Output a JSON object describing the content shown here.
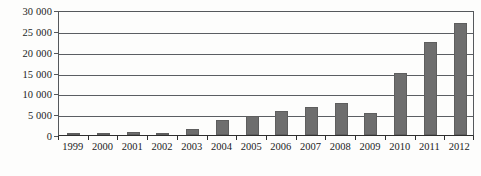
{
  "chart_data": {
    "type": "bar",
    "title": "",
    "xlabel": "",
    "ylabel": "",
    "categories": [
      "1999",
      "2000",
      "2001",
      "2002",
      "2003",
      "2004",
      "2005",
      "2006",
      "2007",
      "2008",
      "2009",
      "2010",
      "2011",
      "2012"
    ],
    "values": [
      200,
      250,
      700,
      600,
      1500,
      3500,
      4500,
      5700,
      6700,
      7700,
      5300,
      14800,
      22400,
      26800
    ],
    "ylim": [
      0,
      30000
    ],
    "ytick_values": [
      0,
      5000,
      10000,
      15000,
      20000,
      25000,
      30000
    ],
    "ytick_labels": [
      "0",
      "5 000",
      "10 000",
      "15 000",
      "20 000",
      "25 000",
      "30 000"
    ],
    "grid": true,
    "legend": null,
    "series": [
      {
        "name": "",
        "values": [
          200,
          250,
          700,
          600,
          1500,
          3500,
          4500,
          5700,
          6700,
          7700,
          5300,
          14800,
          22400,
          26800
        ]
      }
    ],
    "colors": {
      "bar_fill": "#6e6e6e",
      "bar_stroke": "#5e5e5e",
      "gridline": "#5b5e62",
      "axis": "#2e2e2e",
      "text": "#1c1c1c",
      "background": "#fdfdfc"
    }
  }
}
